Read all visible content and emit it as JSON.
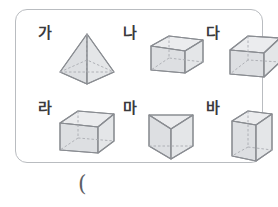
{
  "worksheet": {
    "frame_label": "shapes-frame",
    "shapes": [
      {
        "label": "가",
        "name": "square-pyramid",
        "kind": "pyramid"
      },
      {
        "label": "나",
        "name": "rectangular-prism-wide",
        "kind": "box"
      },
      {
        "label": "다",
        "name": "cube",
        "kind": "box"
      },
      {
        "label": "라",
        "name": "rectangular-prism",
        "kind": "box"
      },
      {
        "label": "마",
        "name": "triangular-prism",
        "kind": "prism"
      },
      {
        "label": "바",
        "name": "rectangular-prism-tall",
        "kind": "box"
      }
    ]
  },
  "answer": {
    "paren": "("
  },
  "colors": {
    "frame_border": "#b9bcc0",
    "edge": "#8a8d92",
    "hidden_edge": "#a9acb1",
    "face_top": "#ebecee",
    "face_left": "#dddfe2",
    "face_right": "#e4e6e8",
    "label_text": "#3a3a3c",
    "background": "#ffffff"
  }
}
